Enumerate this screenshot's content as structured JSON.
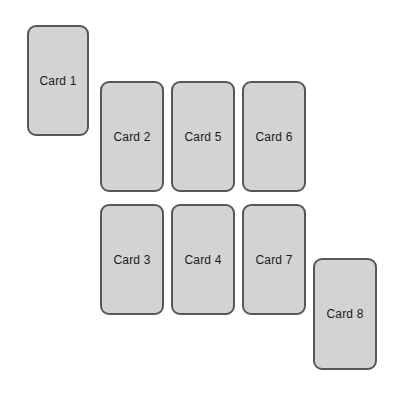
{
  "canvas": {
    "width": 405,
    "height": 398,
    "background_color": "#ffffff"
  },
  "style": {
    "card_fill_color": "#d3d3d3",
    "card_border_color": "#555759",
    "card_text_color": "#1a1a1a",
    "card_corner_radius": 9,
    "card_border_width": 2
  },
  "cards": [
    {
      "label": "Card 1",
      "x": 27,
      "y": 25,
      "width": 62,
      "height": 111
    },
    {
      "label": "Card 2",
      "x": 100,
      "y": 81,
      "width": 64,
      "height": 111
    },
    {
      "label": "Card 5",
      "x": 171,
      "y": 81,
      "width": 64,
      "height": 111
    },
    {
      "label": "Card 6",
      "x": 242,
      "y": 81,
      "width": 64,
      "height": 111
    },
    {
      "label": "Card 3",
      "x": 100,
      "y": 204,
      "width": 64,
      "height": 111
    },
    {
      "label": "Card 4",
      "x": 171,
      "y": 204,
      "width": 64,
      "height": 111
    },
    {
      "label": "Card 7",
      "x": 242,
      "y": 204,
      "width": 64,
      "height": 111
    },
    {
      "label": "Card 8",
      "x": 313,
      "y": 258,
      "width": 64,
      "height": 112
    }
  ]
}
